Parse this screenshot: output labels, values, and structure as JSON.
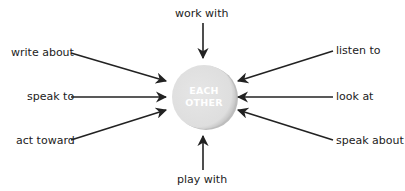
{
  "diagram": {
    "center": {
      "line1": "EACH",
      "line2": "OTHER",
      "fill": "#e3e3e3",
      "edge": "#bdbdbd"
    },
    "arrow_color": "#222222",
    "labels": {
      "top": "work with",
      "bottom": "play with",
      "left_top": "write about",
      "left_mid": "speak to",
      "left_bottom": "act toward",
      "right_top": "listen to",
      "right_mid": "look at",
      "right_bottom": "speak about"
    }
  }
}
